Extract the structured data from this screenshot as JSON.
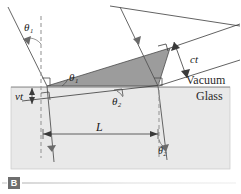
{
  "figure": {
    "panel_label": "B",
    "caption_rule": true
  },
  "media": {
    "vacuum_label": "Vacuum",
    "glass_label": "Glass",
    "vacuum_fill": "#ffffff",
    "glass_fill": "#e9e9e9",
    "wavefront_fill": "#9a9a9a",
    "line_color": "#3a3a3a",
    "dashed_color": "#8a8a8a"
  },
  "labels": {
    "theta1_incident": "θ₁",
    "theta1_wavefront": "θ₁",
    "theta2_refracted": "θ₂",
    "theta2_bottom": "θ₂",
    "ct": "ct",
    "vt": "vt",
    "L": "L"
  },
  "geometry": {
    "interface_y": 87,
    "left_entry_point": [
      47,
      86
    ],
    "right_entry_point": [
      158,
      86
    ],
    "L_value_label": "L",
    "ct_label": "ct",
    "vt_label": "vt"
  },
  "annotations": {
    "right_angle_marks": 4,
    "dashed_normals": 2,
    "incident_rays": 2,
    "refracted_rays": 2
  }
}
